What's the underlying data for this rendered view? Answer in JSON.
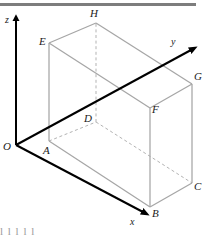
{
  "figure": {
    "type": "3d-coordinate-box-diagram",
    "background_color": "#ffffff",
    "axis_color": "#000000",
    "box_edge_color": "#a6a6a6",
    "hidden_edge_color": "#b3b3b3",
    "label_color": "#1a1a1a",
    "rule_color": "#7d7d7d"
  },
  "top_rule": {
    "name": "top-divider-rule"
  },
  "axes": [
    {
      "id": "z",
      "label": "z",
      "label_x": 5,
      "label_y": 15,
      "from_x": 16,
      "from_y": 145,
      "to_x": 16,
      "to_y": 20
    },
    {
      "id": "y",
      "label": "y",
      "label_x": 171,
      "label_y": 37,
      "from_x": 16,
      "from_y": 145,
      "to_x": 191,
      "to_y": 50
    },
    {
      "id": "x",
      "label": "x",
      "label_x": 130,
      "label_y": 217,
      "from_x": 16,
      "from_y": 145,
      "to_x": 143,
      "to_y": 212
    }
  ],
  "vertices": [
    {
      "id": "O",
      "label": "O",
      "x": 16,
      "y": 145,
      "label_x": 3,
      "label_y": 141
    },
    {
      "id": "A",
      "label": "A",
      "x": 49,
      "y": 141,
      "label_x": 43,
      "label_y": 145
    },
    {
      "id": "B",
      "label": "B",
      "x": 150,
      "y": 207,
      "label_x": 152,
      "label_y": 208
    },
    {
      "id": "C",
      "label": "C",
      "x": 192,
      "y": 183,
      "label_x": 194,
      "label_y": 181
    },
    {
      "id": "D",
      "label": "D",
      "x": 96,
      "y": 122,
      "label_x": 84,
      "label_y": 113
    },
    {
      "id": "E",
      "label": "E",
      "x": 49,
      "y": 43,
      "label_x": 39,
      "label_y": 36
    },
    {
      "id": "F",
      "label": "F",
      "x": 150,
      "y": 108,
      "label_x": 152,
      "label_y": 104
    },
    {
      "id": "G",
      "label": "G",
      "x": 192,
      "y": 84,
      "label_x": 194,
      "label_y": 71
    },
    {
      "id": "H",
      "label": "H",
      "x": 96,
      "y": 23,
      "label_x": 90,
      "label_y": 8
    }
  ],
  "solid_edges": [
    {
      "name": "edge-A-B",
      "from": "A",
      "to": "B"
    },
    {
      "name": "edge-B-C",
      "from": "B",
      "to": "C"
    },
    {
      "name": "edge-A-E",
      "from": "A",
      "to": "E"
    },
    {
      "name": "edge-B-F",
      "from": "B",
      "to": "F"
    },
    {
      "name": "edge-C-G",
      "from": "C",
      "to": "G"
    },
    {
      "name": "edge-E-F",
      "from": "E",
      "to": "F"
    },
    {
      "name": "edge-F-G",
      "from": "F",
      "to": "G"
    },
    {
      "name": "edge-E-H",
      "from": "E",
      "to": "H"
    },
    {
      "name": "edge-H-G",
      "from": "H",
      "to": "G"
    }
  ],
  "dashed_edges": [
    {
      "name": "edge-A-D",
      "from": "A",
      "to": "D"
    },
    {
      "name": "edge-D-C",
      "from": "D",
      "to": "C"
    },
    {
      "name": "edge-D-H",
      "from": "D",
      "to": "H"
    }
  ],
  "bottom_strip": {
    "text": "l             l     l  l l"
  }
}
